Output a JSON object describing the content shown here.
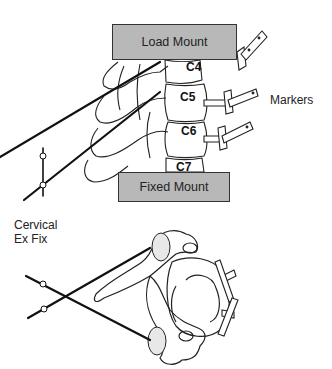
{
  "figure": {
    "load_mount_label": "Load Mount",
    "fixed_mount_label": "Fixed Mount",
    "markers_label": "Markers",
    "fixator_label_line1": "Cervical",
    "fixator_label_line2": "Ex Fix",
    "vertebrae": [
      "C4",
      "C5",
      "C6",
      "C7"
    ]
  }
}
